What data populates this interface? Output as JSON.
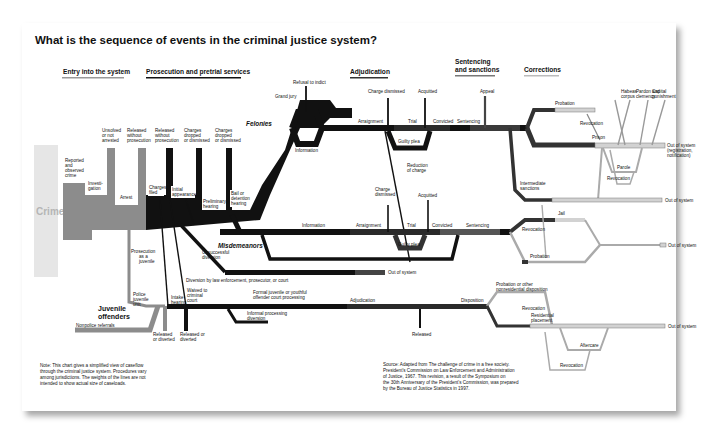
{
  "title": "What is the sequence of events in the criminal justice system?",
  "sections": {
    "entry": "Entry into the system",
    "prosecution": "Prosecution and pretrial services",
    "adjudication": "Adjudication",
    "sentencing_1": "Sentencing",
    "sentencing_2": "and sanctions",
    "corrections": "Corrections"
  },
  "entry": {
    "crime": "Crime",
    "reported": [
      "Reported",
      "and",
      "observed",
      "crime"
    ],
    "investigation": [
      "Investi-",
      "gation"
    ],
    "unsolved": [
      "Unsolved",
      "or not",
      "arrested"
    ],
    "released_wo_pros": [
      "Released",
      "without",
      "prosecution"
    ],
    "arrest": "Arrest"
  },
  "prosecution": {
    "charges_filed": [
      "Charges",
      "filed"
    ],
    "released_wo_pros_2": [
      "Released",
      "without",
      "prosecution"
    ],
    "initial_appearance": [
      "Initial",
      "appearance"
    ],
    "charges_dropped_1": [
      "Charges",
      "dropped",
      "or dismissed"
    ],
    "preliminary_hearing": [
      "Preliminary",
      "hearing"
    ],
    "charges_dropped_2": [
      "Charges",
      "dropped",
      "or dismissed"
    ],
    "bail": [
      "Bail or",
      "detention",
      "hearing"
    ],
    "unsuccessful_diversion": [
      "Unsuccessful",
      "diversion"
    ],
    "diversion": "Diversion by law enforcement, prosecutor, or court",
    "prosecution_as_juvenile": [
      "Prosecution",
      "as a",
      "juvenile"
    ]
  },
  "felonies": {
    "label": "Felonies",
    "refusal": "Refusal to indict",
    "grand_jury": "Grand jury",
    "information": "Information",
    "arraignment": "Arraignment",
    "charge_dismissed": "Charge dismissed",
    "trial": "Trial",
    "acquitted": "Acquitted",
    "guilty_plea": "Guilty plea",
    "convicted": "Convicted",
    "sentencing": "Sentencing",
    "appeal": "Appeal",
    "reduction": [
      "Reduction",
      "of charge"
    ]
  },
  "misdemeanors": {
    "label": "Misdemeanors",
    "information": "Information",
    "arraignment": "Arraignment",
    "charge_dismissed": [
      "Charge",
      "dismissed"
    ],
    "trial": "Trial",
    "acquitted": "Acquitted",
    "guilty_plea": "Guilty plea",
    "convicted": "Convicted",
    "sentencing": "Sentencing",
    "out_of_system": "Out of system"
  },
  "corrections": {
    "probation": "Probation",
    "revocation": "Revocation",
    "prison": "Prison",
    "habeas": [
      "Habeas",
      "corpus"
    ],
    "pardon": [
      "Pardon and",
      "clemency"
    ],
    "capital": [
      "Capital",
      "punishment"
    ],
    "out_registration": [
      "Out of system",
      "(registration,",
      "notification)"
    ],
    "parole": "Parole",
    "revocation_parole": "Revocation",
    "intermediate": [
      "Intermediate",
      "sanctions"
    ],
    "out_1": "Out of system",
    "jail": "Jail",
    "revocation_jail": "Revocation",
    "probation_2": "Probation",
    "out_2": "Out of system"
  },
  "juvenile": {
    "label_1": "Juvenile",
    "label_2": "offenders",
    "police_unit": [
      "Police",
      "juvenile",
      "unit"
    ],
    "nonpolice": "Nonpolice referrals",
    "intake": [
      "Intake",
      "hearing"
    ],
    "waived": [
      "Waived to",
      "criminal",
      "court"
    ],
    "released_diverted_1": [
      "Released",
      "or diverted"
    ],
    "released_diverted_2": [
      "Released or",
      "diverted"
    ],
    "formal": [
      "Formal juvenile or youthful",
      "offender court processing"
    ],
    "informal": [
      "Informal processing",
      "diversion"
    ],
    "adjudication": "Adjudication",
    "released": "Released",
    "disposition": "Disposition",
    "probation_other": [
      "Probation or other",
      "nonresidential disposition"
    ],
    "revocation": "Revocation",
    "residential": [
      "Residential",
      "placement"
    ],
    "aftercare": "Aftercare",
    "revocation_2": "Revocation",
    "out": "Out of system"
  },
  "note": [
    "Note: This chart gives a simplified view of caseflow",
    "through the criminal justice system. Procedures vary",
    "among jurisdictions. The weights of the lines are not",
    "intended to show actual size of caseloads."
  ],
  "source": [
    "Source: Adapted from The challenge of crime in a free society.",
    "President's Commission on Law Enforcement and Administration",
    "of Justice, 1967. This revision, a result of the Symposium on",
    "the 30th Anniversary of the President's Commission, was prepared",
    "by the Bureau of Justice Statistics in 1997."
  ],
  "colors": {
    "black": "#111111",
    "dark_gray": "#3a3a3a",
    "mid_gray": "#8c8c8c",
    "light_gray": "#d2d2d2",
    "crime_bar": "#e6e6e6"
  }
}
